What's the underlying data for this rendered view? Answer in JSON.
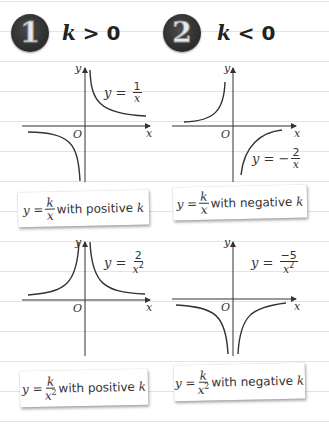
{
  "header_fragment": "...",
  "sections": [
    {
      "badge": "1",
      "condition_var": "k",
      "condition_op": ">",
      "condition_value": "0"
    },
    {
      "badge": "2",
      "condition_var": "k",
      "condition_op": "<",
      "condition_value": "0"
    }
  ],
  "graphs": [
    {
      "equation_lhs": "y =",
      "equation_sign": "",
      "numerator": "1",
      "denominator": "x",
      "power": "",
      "x_label": "x",
      "y_label": "y",
      "origin_label": "O",
      "curve": "k/x, k>0"
    },
    {
      "equation_lhs": "y =",
      "equation_sign": "−",
      "numerator": "2",
      "denominator": "x",
      "power": "",
      "x_label": "x",
      "y_label": "y",
      "origin_label": "O",
      "curve": "k/x, k<0"
    },
    {
      "equation_lhs": "y =",
      "equation_sign": "",
      "numerator": "2",
      "denominator": "x",
      "power": "2",
      "x_label": "x",
      "y_label": "y",
      "origin_label": "O",
      "curve": "k/x^2, k>0"
    },
    {
      "equation_lhs": "y =",
      "equation_sign": "",
      "numerator": "−5",
      "denominator": "x",
      "power": "2",
      "x_label": "x",
      "y_label": "y",
      "origin_label": "O",
      "curve": "k/x^2, k<0"
    }
  ],
  "cards": [
    {
      "lhs": "y =",
      "numerator": "k",
      "denominator": "x",
      "power": "",
      "text": "with positive",
      "var": "k"
    },
    {
      "lhs": "y =",
      "numerator": "k",
      "denominator": "x",
      "power": "",
      "text": "with negative",
      "var": "k"
    },
    {
      "lhs": "y =",
      "numerator": "k",
      "denominator": "x",
      "power": "2",
      "text": "with positive",
      "var": "k"
    },
    {
      "lhs": "y =",
      "numerator": "k",
      "denominator": "x",
      "power": "2",
      "text": "with negative",
      "var": "k"
    }
  ]
}
